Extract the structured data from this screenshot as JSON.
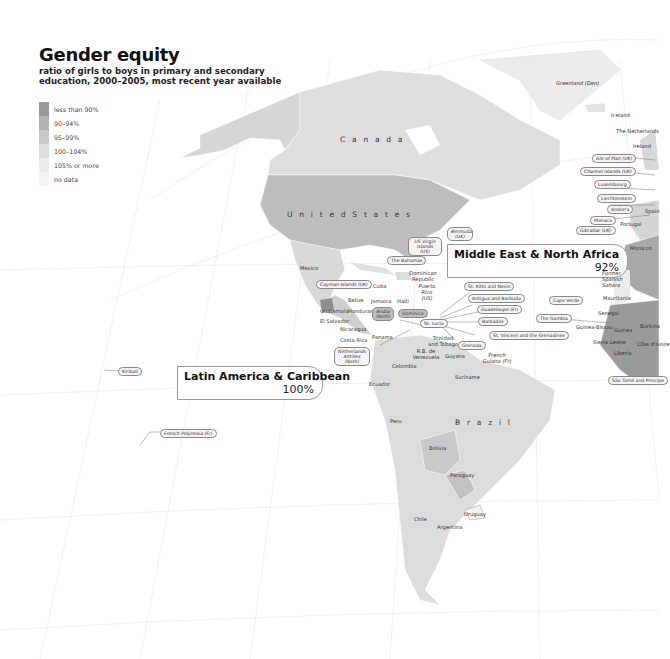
{
  "header": {
    "title": "Gender equity",
    "subtitle_line1": "ratio of girls to boys in primary and secondary",
    "subtitle_line2": "education, 2000–2005, most recent year available"
  },
  "legend": [
    {
      "label": "less than 90%",
      "color": "#9a9a9a"
    },
    {
      "label": "90–94%",
      "color": "#b3b3b3"
    },
    {
      "label": "95–99%",
      "color": "#c9c9c9"
    },
    {
      "label": "100–104%",
      "color": "#dcdcdc"
    },
    {
      "label": "105% or more",
      "color": "#ececec"
    },
    {
      "label": "no data",
      "color": "#f5f5f5"
    }
  ],
  "callouts": {
    "mena": {
      "name": "Middle East & North Africa",
      "value": "92%"
    },
    "lac": {
      "name": "Latin America & Caribbean",
      "value": "100%"
    }
  },
  "countries_large": {
    "canada": "C a n a d a",
    "usa": "U n i t e d   S t a t e s",
    "brazil": "B r a z i l"
  },
  "country_labels": {
    "greenland": "Greenland (Den)",
    "iceland": "Iceland",
    "netherlands": "The Netherlands",
    "uk": "United Kingdom",
    "ireland": "Ireland",
    "spain": "Spain",
    "portugal": "Portugal",
    "morocco": "Morocco",
    "western_sahara": "Former Spanish Sahara",
    "mauritania": "Mauritania",
    "senegal": "Senegal",
    "guinea_bissau": "Guinea-Bissau",
    "guinea": "Guinea",
    "sierra_leone": "Sierra Leone",
    "liberia": "Liberia",
    "cote_divoire": "Côte d'Ivoire",
    "burkina": "Burkina",
    "mali": "Mali",
    "mexico": "Mexico",
    "cuba": "Cuba",
    "belize": "Belize",
    "guatemala": "Guatemala",
    "honduras": "Honduras",
    "el_salvador": "El Salvador",
    "nicaragua": "Nicaragua",
    "costa_rica": "Costa Rica",
    "panama": "Panama",
    "jamaica": "Jamaica",
    "haiti": "Haiti",
    "dominican_republic": "Dominican Republic",
    "puerto_rico": "Puerto Rico (US)",
    "trinidad": "Trinidad and Tobago",
    "venezuela": "R.B. de Venezuela",
    "guyana": "Guyana",
    "suriname": "Suriname",
    "french_guiana": "French Guiana (Fr)",
    "colombia": "Colombia",
    "ecuador": "Ecuador",
    "peru": "Peru",
    "bolivia": "Bolivia",
    "paraguay": "Paraguay",
    "chile": "Chile",
    "argentina": "Argentina",
    "uruguay": "Uruguay"
  },
  "pill_labels": {
    "faroe": "Faeroe Islands (Den)",
    "isle_of_man": "Isle of Man (UK)",
    "channel_islands": "Channel Islands (UK)",
    "luxembourg": "Luxembourg",
    "liechtenstein": "Liechtenstein",
    "andorra": "Andorra",
    "monaco": "Monaco",
    "gibraltar": "Gibraltar (UK)",
    "bermuda": "Bermuda (UK)",
    "us_virgin": "US Virgin Islands (US)",
    "bahamas": "The Bahamas",
    "cayman": "Cayman Islands (UK)",
    "aruba": "Aruba (Neth)",
    "dominica": "Dominica",
    "st_lucia": "St. Lucia",
    "netherlands_antilles": "Netherlands Antilles (Neth)",
    "st_kitts": "St. Kitts and Nevis",
    "antigua": "Antigua and Barbuda",
    "guadeloupe": "Guadeloupe (Fr)",
    "barbados": "Barbados",
    "st_vincent": "St. Vincent and the Grenadines",
    "grenada": "Grenada",
    "cape_verde": "Cape Verde",
    "gambia": "The Gambia",
    "sao_tome": "São Tomé and Principe",
    "kiribati": "Kiribati",
    "french_polynesia": "French Polynesia (Fr)"
  }
}
